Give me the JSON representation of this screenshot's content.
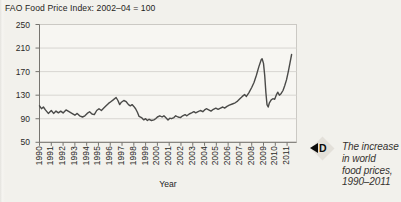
{
  "title": "FAO Food Price Index: 2002–04 = 100",
  "axis": {
    "x_title": "Year"
  },
  "marker": {
    "letter": "D",
    "arrow_direction": "left"
  },
  "caption": {
    "lines": [
      "The increase",
      "in world",
      "food prices,",
      "1990–2011"
    ]
  },
  "colors": {
    "background": "#f2f1ec",
    "plot_background": "#f7f6f2",
    "grid": "#d8d6d1",
    "frame": "#cbc9c4",
    "axis": "#76746f",
    "line": "#4a4a48",
    "marker_diamond": "#e3e0d9",
    "marker_black": "#0b0b0b"
  },
  "chart_data": {
    "type": "line",
    "title": "FAO Food Price Index: 2002–04 = 100",
    "xlabel": "Year",
    "ylabel": "",
    "ylim": [
      50,
      250
    ],
    "yticks": [
      50,
      90,
      130,
      170,
      210,
      250
    ],
    "xticks": [
      1990,
      1991,
      1992,
      1993,
      1994,
      1995,
      1996,
      1997,
      1998,
      1999,
      2000,
      2001,
      2002,
      2003,
      2004,
      2005,
      2006,
      2007,
      2008,
      2009,
      2010,
      2011
    ],
    "grid": true,
    "legend": "none",
    "series": [
      {
        "name": "FAO Food Price Index",
        "points": [
          [
            1990.0,
            112
          ],
          [
            1990.17,
            107
          ],
          [
            1990.33,
            110
          ],
          [
            1990.5,
            105
          ],
          [
            1990.75,
            99
          ],
          [
            1991.0,
            104
          ],
          [
            1991.2,
            99
          ],
          [
            1991.4,
            103
          ],
          [
            1991.6,
            100
          ],
          [
            1991.8,
            103
          ],
          [
            1992.0,
            100
          ],
          [
            1992.25,
            105
          ],
          [
            1992.5,
            102
          ],
          [
            1992.75,
            99
          ],
          [
            1993.0,
            96
          ],
          [
            1993.2,
            99
          ],
          [
            1993.4,
            95
          ],
          [
            1993.65,
            93
          ],
          [
            1993.85,
            95
          ],
          [
            1994.05,
            99
          ],
          [
            1994.25,
            102
          ],
          [
            1994.45,
            98
          ],
          [
            1994.65,
            97
          ],
          [
            1994.85,
            104
          ],
          [
            1995.05,
            107
          ],
          [
            1995.25,
            104
          ],
          [
            1995.45,
            108
          ],
          [
            1995.65,
            112
          ],
          [
            1995.85,
            116
          ],
          [
            1996.05,
            119
          ],
          [
            1996.25,
            122
          ],
          [
            1996.5,
            126
          ],
          [
            1996.65,
            121
          ],
          [
            1996.8,
            114
          ],
          [
            1996.95,
            118
          ],
          [
            1997.15,
            121
          ],
          [
            1997.35,
            119
          ],
          [
            1997.55,
            114
          ],
          [
            1997.7,
            112
          ],
          [
            1997.85,
            114
          ],
          [
            1998.0,
            111
          ],
          [
            1998.15,
            107
          ],
          [
            1998.3,
            101
          ],
          [
            1998.45,
            94
          ],
          [
            1998.65,
            92
          ],
          [
            1998.85,
            88
          ],
          [
            1999.0,
            90
          ],
          [
            1999.15,
            87
          ],
          [
            1999.3,
            89
          ],
          [
            1999.5,
            87
          ],
          [
            1999.7,
            88
          ],
          [
            1999.85,
            90
          ],
          [
            2000.0,
            93
          ],
          [
            2000.2,
            95
          ],
          [
            2000.4,
            93
          ],
          [
            2000.55,
            95
          ],
          [
            2000.7,
            92
          ],
          [
            2000.9,
            88
          ],
          [
            2001.05,
            91
          ],
          [
            2001.2,
            90
          ],
          [
            2001.4,
            92
          ],
          [
            2001.55,
            95
          ],
          [
            2001.75,
            93
          ],
          [
            2001.95,
            92
          ],
          [
            2002.15,
            95
          ],
          [
            2002.35,
            97
          ],
          [
            2002.5,
            95
          ],
          [
            2002.7,
            98
          ],
          [
            2002.9,
            100
          ],
          [
            2003.1,
            102
          ],
          [
            2003.25,
            100
          ],
          [
            2003.45,
            102
          ],
          [
            2003.65,
            104
          ],
          [
            2003.85,
            102
          ],
          [
            2004.0,
            105
          ],
          [
            2004.15,
            107
          ],
          [
            2004.35,
            105
          ],
          [
            2004.55,
            103
          ],
          [
            2004.75,
            106
          ],
          [
            2004.95,
            108
          ],
          [
            2005.15,
            106
          ],
          [
            2005.35,
            108
          ],
          [
            2005.55,
            110
          ],
          [
            2005.7,
            108
          ],
          [
            2005.9,
            111
          ],
          [
            2006.1,
            113
          ],
          [
            2006.35,
            115
          ],
          [
            2006.6,
            117
          ],
          [
            2006.8,
            120
          ],
          [
            2007.0,
            124
          ],
          [
            2007.2,
            128
          ],
          [
            2007.4,
            131
          ],
          [
            2007.55,
            128
          ],
          [
            2007.75,
            134
          ],
          [
            2008.0,
            143
          ],
          [
            2008.2,
            152
          ],
          [
            2008.4,
            164
          ],
          [
            2008.6,
            178
          ],
          [
            2008.8,
            190
          ],
          [
            2008.88,
            192
          ],
          [
            2009.0,
            184
          ],
          [
            2009.1,
            164
          ],
          [
            2009.2,
            134
          ],
          [
            2009.3,
            114
          ],
          [
            2009.4,
            110
          ],
          [
            2009.5,
            117
          ],
          [
            2009.65,
            122
          ],
          [
            2009.8,
            124
          ],
          [
            2009.95,
            123
          ],
          [
            2010.1,
            131
          ],
          [
            2010.2,
            135
          ],
          [
            2010.35,
            130
          ],
          [
            2010.5,
            133
          ],
          [
            2010.65,
            138
          ],
          [
            2010.8,
            146
          ],
          [
            2010.95,
            156
          ],
          [
            2011.1,
            170
          ],
          [
            2011.25,
            185
          ],
          [
            2011.38,
            199
          ]
        ]
      }
    ]
  }
}
